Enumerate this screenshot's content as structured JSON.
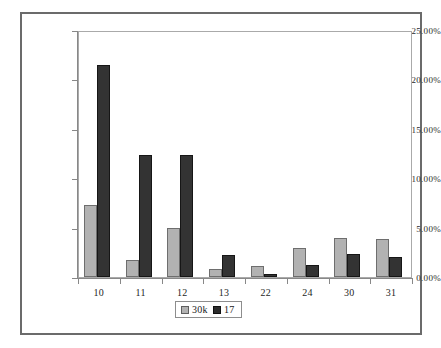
{
  "chart_data": {
    "type": "bar",
    "title": "",
    "subtitle": "",
    "xlabel": "",
    "ylabel": "",
    "categories": [
      "10",
      "11",
      "12",
      "13",
      "22",
      "24",
      "30",
      "31"
    ],
    "series": [
      {
        "name": "30k",
        "color": "#b2b2b2",
        "values": [
          7.3,
          1.7,
          5.0,
          0.8,
          1.1,
          2.9,
          3.9,
          3.8
        ]
      },
      {
        "name": "17",
        "color": "#333333",
        "values": [
          21.5,
          12.3,
          12.4,
          2.2,
          0.3,
          1.2,
          2.3,
          2.0
        ]
      }
    ],
    "ylim": [
      0,
      25
    ],
    "ytick_values": [
      0,
      5,
      10,
      15,
      20,
      25
    ],
    "ytick_labels": [
      "0.00%",
      "5.00%",
      "10.00%",
      "15.00%",
      "20.00%",
      "25.00%"
    ],
    "grid": false,
    "legend_position": "bottom-center",
    "legend_entries": [
      "30k",
      "17"
    ],
    "value_format": "percent"
  },
  "axes": {
    "y_labels": [
      "25.00%",
      "20.00%",
      "15.00%",
      "10.00%",
      "5.00%",
      "0.00%"
    ],
    "x_labels": [
      "10",
      "11",
      "12",
      "13",
      "22",
      "24",
      "30",
      "31"
    ]
  },
  "legend": {
    "items": [
      {
        "label": "30k",
        "swatch": "light-gray-swatch-icon"
      },
      {
        "label": "17",
        "swatch": "dark-gray-swatch-icon"
      }
    ]
  }
}
